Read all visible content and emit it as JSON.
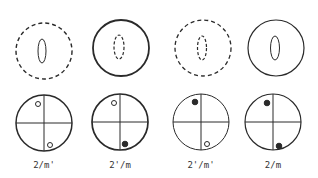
{
  "diagram": {
    "ink_color": "#2a2a2a",
    "columns": [
      {
        "label": "2/m'",
        "domain": {
          "outer": "dashed",
          "inner": "solid"
        },
        "stereogram": {
          "upper": "open",
          "lower": "open"
        }
      },
      {
        "label": "2'/m",
        "domain": {
          "outer": "solid",
          "inner": "dashed"
        },
        "stereogram": {
          "upper": "open",
          "lower": "filled"
        }
      },
      {
        "label": "2'/m'",
        "domain": {
          "outer": "dashed",
          "inner": "dashed"
        },
        "stereogram": {
          "upper": "filled",
          "lower": "open"
        }
      },
      {
        "label": "2/m",
        "domain": {
          "outer": "solid",
          "inner": "solid"
        },
        "stereogram": {
          "upper": "filled",
          "lower": "filled"
        }
      }
    ]
  }
}
